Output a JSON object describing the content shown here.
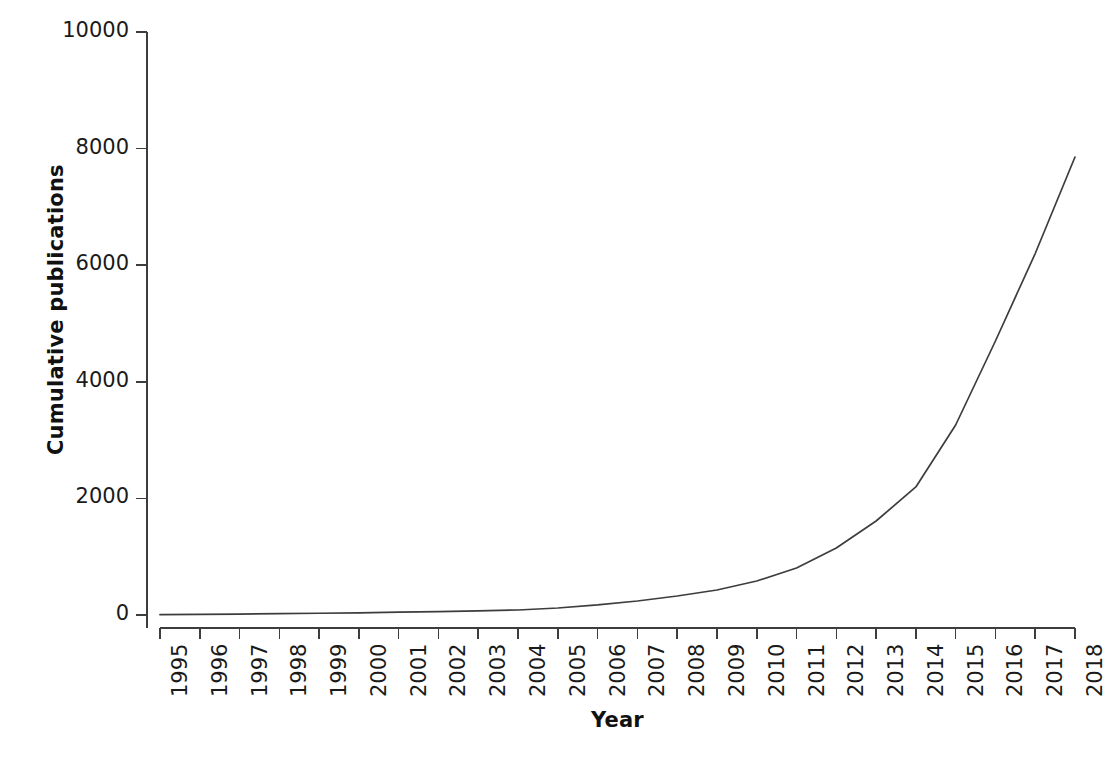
{
  "chart_data": {
    "type": "line",
    "title": "",
    "xlabel": "Year",
    "ylabel": "Cumulative publications",
    "x": [
      1995,
      1996,
      1997,
      1998,
      1999,
      2000,
      2001,
      2002,
      2003,
      2004,
      2005,
      2006,
      2007,
      2008,
      2009,
      2010,
      2011,
      2012,
      2013,
      2014,
      2015,
      2016,
      2017,
      2018
    ],
    "values": [
      5,
      10,
      16,
      22,
      30,
      38,
      48,
      58,
      70,
      86,
      120,
      172,
      240,
      326,
      429,
      583,
      806,
      1149,
      1612,
      2196,
      3259,
      4700,
      6200,
      7855
    ],
    "series": [
      {
        "name": "Cumulative publications",
        "values": [
          5,
          10,
          16,
          22,
          30,
          38,
          48,
          58,
          70,
          86,
          120,
          172,
          240,
          326,
          429,
          583,
          806,
          1149,
          1612,
          2196,
          3259,
          4700,
          6200,
          7855
        ]
      }
    ],
    "xtick_labels": [
      "1995",
      "1996",
      "1997",
      "1998",
      "1999",
      "2000",
      "2001",
      "2002",
      "2003",
      "2004",
      "2005",
      "2006",
      "2007",
      "2008",
      "2009",
      "2010",
      "2011",
      "2012",
      "2013",
      "2014",
      "2015",
      "2016",
      "2017",
      "2018"
    ],
    "ytick_labels": [
      "0",
      "2000",
      "4000",
      "6000",
      "8000",
      "10000"
    ],
    "yticks": [
      0,
      2000,
      4000,
      6000,
      8000,
      10000
    ],
    "ylim": [
      0,
      10000
    ],
    "xlim": [
      1995,
      2018
    ],
    "grid": false,
    "legend": null,
    "line_color": "#3d3d3d",
    "axis_color": "#3d3d3d",
    "background_color": "#ffffff"
  }
}
